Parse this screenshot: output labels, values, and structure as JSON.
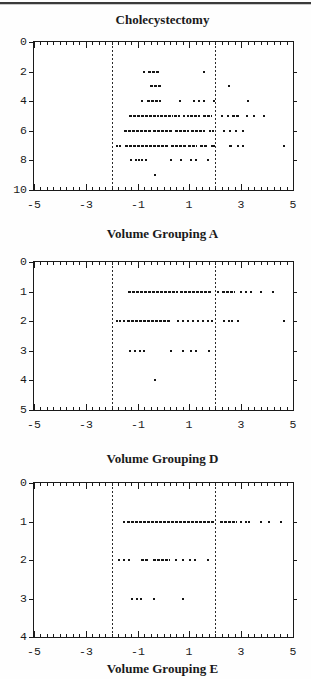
{
  "figure": {
    "title": "Cholecystectomy"
  },
  "colors": {
    "ink": "#1a1a1a",
    "background": "#ffffff",
    "rule_dark": "#3a3a3a",
    "rule_light": "#c9c9c9"
  },
  "chart_data": [
    {
      "type": "scatter",
      "title": "Cholecystectomy",
      "xlabel": "Volume Grouping A",
      "xlim": [
        -5,
        5
      ],
      "ylim": [
        0,
        10
      ],
      "y_direction": "down",
      "xticks": [
        -5,
        -3,
        -1,
        1,
        3,
        5
      ],
      "minor_xtick_step": 0.25,
      "yticks": [
        0,
        2,
        4,
        6,
        8,
        10
      ],
      "right_yticks": [
        2,
        4,
        6,
        8
      ],
      "vlines": [
        -2,
        2
      ],
      "grid": false,
      "rows": [
        {
          "y": 2,
          "segments": [
            [
              -0.58,
              -0.12
            ]
          ],
          "points": [
            -0.81,
            1.54
          ]
        },
        {
          "y": 3,
          "segments": [
            [
              -0.54,
              -0.08
            ]
          ],
          "points": [
            2.5
          ]
        },
        {
          "y": 4,
          "segments": [
            [
              -0.62,
              -0.08
            ]
          ],
          "points": [
            -0.85,
            0.58,
            1.15,
            1.35,
            1.54,
            1.91,
            3.22
          ]
        },
        {
          "y": 5,
          "segments": [
            [
              -1.35,
              -0.19
            ],
            [
              -0.12,
              0.35
            ],
            [
              0.42,
              0.65
            ],
            [
              1.04,
              1.42
            ],
            [
              1.54,
              1.88
            ],
            [
              2.64,
              2.96
            ]
          ],
          "points": [
            0.77,
            0.92,
            2.22,
            2.45,
            3.19,
            3.47,
            3.85
          ]
        },
        {
          "y": 6,
          "segments": [
            [
              -1.53,
              -0.5
            ],
            [
              -0.42,
              0.33
            ],
            [
              0.46,
              1.0
            ],
            [
              1.08,
              1.62
            ]
          ],
          "points": [
            1.75,
            1.88,
            2.28,
            2.51,
            2.77,
            3.03
          ]
        },
        {
          "y": 7,
          "segments": [
            [
              -1.5,
              0.2
            ],
            [
              0.3,
              0.85
            ],
            [
              0.95,
              1.3
            ],
            [
              1.4,
              1.68
            ],
            [
              2.51,
              2.7
            ]
          ],
          "points": [
            -1.85,
            -1.72,
            1.83,
            1.93,
            2.83,
            3.03,
            4.6
          ]
        },
        {
          "y": 8,
          "segments": [],
          "points": [
            -1.3,
            -1.1,
            -0.97,
            -0.85,
            -0.7,
            0.27,
            0.65,
            1.04,
            1.2,
            1.68
          ]
        },
        {
          "y": 9,
          "segments": [],
          "points": [
            -0.38
          ]
        }
      ]
    },
    {
      "type": "scatter",
      "title": "",
      "xlabel": "Volume Grouping D",
      "xlim": [
        -5,
        5
      ],
      "ylim": [
        0,
        5
      ],
      "y_direction": "down",
      "xticks": [
        -5,
        -3,
        -1,
        1,
        3,
        5
      ],
      "minor_xtick_step": 0.25,
      "yticks": [
        0,
        1,
        2,
        3,
        4,
        5
      ],
      "right_yticks": [
        1,
        2,
        3,
        4
      ],
      "vlines": [
        -2,
        2
      ],
      "grid": false,
      "rows": [
        {
          "y": 1,
          "segments": [
            [
              -1.36,
              0.55
            ],
            [
              0.62,
              1.88
            ],
            [
              2.26,
              2.77
            ]
          ],
          "points": [
            2.07,
            2.96,
            3.15,
            3.35,
            3.73,
            4.19
          ]
        },
        {
          "y": 2,
          "segments": [
            [
              -1.4,
              0.27
            ]
          ],
          "points": [
            -1.84,
            -1.73,
            -1.55,
            0.53,
            0.72,
            0.91,
            1.1,
            1.3,
            1.49,
            1.68,
            1.85,
            2.28,
            2.5,
            2.62,
            2.85,
            4.6
          ]
        },
        {
          "y": 3,
          "segments": [],
          "points": [
            -1.33,
            -1.12,
            -0.96,
            -0.81,
            0.27,
            0.72,
            1.04,
            1.2,
            1.7
          ]
        },
        {
          "y": 4,
          "segments": [],
          "points": [
            -0.38
          ]
        }
      ]
    },
    {
      "type": "scatter",
      "title": "",
      "xlabel": "Volume Grouping E",
      "xlim": [
        -5,
        5
      ],
      "ylim": [
        0,
        4
      ],
      "y_direction": "down",
      "xticks": [
        -5,
        -3,
        -1,
        1,
        3,
        5
      ],
      "minor_xtick_step": 0.25,
      "yticks": [
        0,
        1,
        2,
        3,
        4
      ],
      "right_yticks": [
        1,
        2,
        3
      ],
      "vlines": [
        -2,
        2
      ],
      "grid": false,
      "rows": [
        {
          "y": 1,
          "segments": [
            [
              -1.42,
              2.0
            ],
            [
              2.19,
              2.83
            ]
          ],
          "points": [
            -1.55,
            2.96,
            3.13,
            3.28,
            3.73,
            4.05,
            4.5
          ]
        },
        {
          "y": 2,
          "segments": [
            [
              -0.88,
              -0.56
            ],
            [
              -0.42,
              0.27
            ]
          ],
          "points": [
            -1.76,
            -1.55,
            -1.36,
            0.46,
            0.72,
            0.97,
            1.17,
            1.68
          ]
        },
        {
          "y": 3,
          "segments": [],
          "points": [
            -1.27,
            -1.08,
            -0.92,
            -0.42,
            0.72
          ]
        }
      ]
    }
  ]
}
